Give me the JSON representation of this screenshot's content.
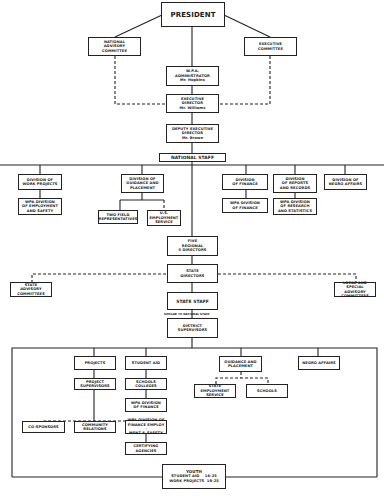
{
  "nodes": {
    "president": "PRESIDENT",
    "national_advisory": "NATIONAL\nADVISORY\nCOMMITTEE",
    "executive_committee": "EXECUTIVE\nCOMMITTEE",
    "wpa_administrator": "W.P.A.\nADMINISTRATOR\nMr. Hopkins",
    "executive_director": "EXECUTIVE\nDIRECTOR\nMr. Williams",
    "deputy_executive_director": "DEPUTY EXECUTIVE\nDIRECTOR\nMr. Brown",
    "national_staff": "NATIONAL STAFF",
    "div_work_projects": "DIVISION OF\nWORK PROJECTS",
    "wpa_div_employment_safety": "WPA DIVISION\nOF EMPLOYMENT\nAND SAFETY",
    "div_guidance_placement": "DIVISION OF\nGUIDANCE AND\nPLACEMENT",
    "two_field_reps": "TWO FIELD\nREPRESENTATIVES",
    "us_employment_service": "U.S.\nEMPLOYMENT\nSERVICE",
    "div_finance": "DIVISION\nOF FINANCE",
    "wpa_div_finance": "WPA DIVISION\nOF FINANCE",
    "div_reports_records": "DIVISION\nOF REPORTS\nAND RECORDS",
    "wpa_div_research_stats": "WPA DIVISION\nOF RESEARCH\nAND STATISTICS",
    "div_negro_affairs": "DIVISION OF\nNEGRO AFFAIRS",
    "five_regional_directors": "FIVE\nREGIONAL\n5 DIRECTORS",
    "state_directors": "STATE\nDIRECTORS",
    "state_advisory": "STATE\nADVISORY\nCOMMITTEES",
    "local_special_advisory": "LOCAL AND\nSPECIAL ADVISORY\nCOMMITTEES",
    "state_staff": "STATE STAFF",
    "state_staff_note": "SIMILAR TO NATIONAL STAFF",
    "district_supervisors": "DISTRICT\nSUPERVISORS",
    "projects": "PROJECTS",
    "project_supervisors": "PROJECT\nSUPERVISORS",
    "student_aid": "STUDENT AID",
    "schools_colleges": "SCHOOLS\nCOLLEGES",
    "wpa_div_finance_2": "WPA DIVISION\nOF FINANCE",
    "guidance_placement": "GUIDANCE AND\nPLACEMENT",
    "state_employment_service": "STATE\nEMPLOYMENT\nSERVICE",
    "schools": "SCHOOLS",
    "negro_affairs": "NEGRO AFFAIRS",
    "co_sponsors": "CO-SPONSORS",
    "community_relations": "COMMUNITY\nRELATIONS",
    "wpa_div_finance_employ_safety": "WPA DIVISION OF\nFINANCE EMPLOY -\nMENT & SAFETY",
    "certifying_agencies": "CERTIFYING\nAGENCIES",
    "youth_title": "YOUTH",
    "youth_student_aid": "STUDENT AID    16-25",
    "youth_work_projects": "WORK PROJECTS  18-25"
  },
  "colors": {
    "line": "#222222",
    "background": "#ffffff"
  }
}
